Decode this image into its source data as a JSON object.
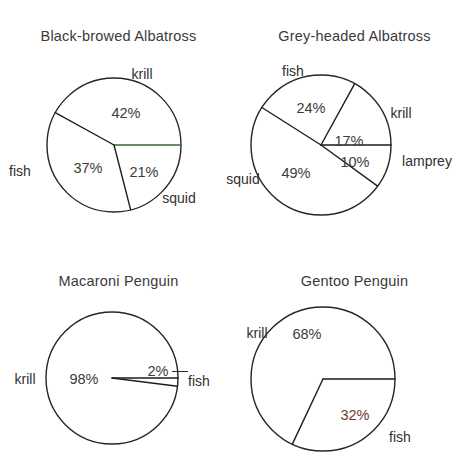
{
  "figure": {
    "background": "#ffffff",
    "outline_color": "#262626",
    "label_color": "#303030",
    "value_color": "#3c3c3c",
    "accent_green": "#2f6b34",
    "accent_maroon": "#6d3a35"
  },
  "chart_data": [
    {
      "type": "pie",
      "title": "Black-browed  Albatross",
      "categories": [
        "krill",
        "fish",
        "squid"
      ],
      "values": [
        42,
        37,
        21
      ],
      "value_labels": [
        "42%",
        "37%",
        "21%"
      ],
      "units": "percent",
      "legend": "none",
      "start_angle_deg": 0,
      "direction": "counterclockwise"
    },
    {
      "type": "pie",
      "title": "Grey-headed  Albatross",
      "categories": [
        "krill",
        "fish",
        "squid",
        "lamprey"
      ],
      "values": [
        17,
        24,
        49,
        10
      ],
      "value_labels": [
        "17%",
        "24%",
        "49%",
        "10%"
      ],
      "units": "percent",
      "legend": "none",
      "start_angle_deg": 0,
      "direction": "counterclockwise"
    },
    {
      "type": "pie",
      "title": "Macaroni  Penguin",
      "categories": [
        "krill",
        "fish"
      ],
      "values": [
        98,
        2
      ],
      "value_labels": [
        "98%",
        "2%"
      ],
      "units": "percent",
      "legend": "none",
      "start_angle_deg": 0,
      "direction": "counterclockwise"
    },
    {
      "type": "pie",
      "title": "Gentoo  Penguin",
      "categories": [
        "krill",
        "fish"
      ],
      "values": [
        68,
        32
      ],
      "value_labels": [
        "68%",
        "32%"
      ],
      "units": "percent",
      "legend": "none",
      "start_angle_deg": 0,
      "direction": "counterclockwise"
    }
  ],
  "panels": [
    {
      "id": "black-browed-albatross",
      "title": "Black-browed  Albatross",
      "geometry": {
        "cx": 114,
        "cy": 145,
        "r": 67
      },
      "slices": [
        {
          "name": "krill",
          "value": "42%",
          "start": 0,
          "end": 151.2,
          "color": "#3c3c3c"
        },
        {
          "name": "fish",
          "value": "37%",
          "start": 151.2,
          "end": 284.4,
          "color": "#3c3c3c"
        },
        {
          "name": "squid",
          "value": "21%",
          "start": 284.4,
          "end": 360,
          "color": "#3c3c3c"
        }
      ],
      "value_positions": [
        {
          "text": "42%",
          "x": 126,
          "y": 113,
          "tone": "normal"
        },
        {
          "text": "37%",
          "x": 88,
          "y": 168,
          "tone": "normal"
        },
        {
          "text": "21%",
          "x": 144,
          "y": 172,
          "tone": "normal"
        }
      ],
      "category_positions": [
        {
          "text": "krill",
          "x": 142,
          "y": 74
        },
        {
          "text": "fish",
          "x": 20,
          "y": 171
        },
        {
          "text": "squid",
          "x": 179,
          "y": 198
        }
      ]
    },
    {
      "id": "grey-headed-albatross",
      "title": "Grey-headed  Albatross",
      "geometry": {
        "cx": 321,
        "cy": 145,
        "r": 70
      },
      "slices": [
        {
          "name": "krill",
          "value": "17%",
          "start": 0,
          "end": 61.2,
          "color": "#3c3c3c"
        },
        {
          "name": "fish",
          "value": "24%",
          "start": 61.2,
          "end": 147.6,
          "color": "#3c3c3c"
        },
        {
          "name": "squid",
          "value": "49%",
          "start": 147.6,
          "end": 324,
          "color": "#3c3c3c"
        },
        {
          "name": "lamprey",
          "value": "10%",
          "start": 324,
          "end": 360,
          "color": "#3c3c3c"
        }
      ],
      "value_positions": [
        {
          "text": "17%",
          "x": 349,
          "y": 141,
          "tone": "normal"
        },
        {
          "text": "24%",
          "x": 311,
          "y": 108,
          "tone": "normal"
        },
        {
          "text": "49%",
          "x": 296,
          "y": 173,
          "tone": "normal"
        },
        {
          "text": "10%",
          "x": 355,
          "y": 162,
          "tone": "normal"
        }
      ],
      "category_positions": [
        {
          "text": "fish",
          "x": 293,
          "y": 71
        },
        {
          "text": "krill",
          "x": 401,
          "y": 113
        },
        {
          "text": "lamprey",
          "x": 427,
          "y": 161
        },
        {
          "text": "squid",
          "x": 243,
          "y": 179
        }
      ]
    },
    {
      "id": "macaroni-penguin",
      "title": "Macaroni  Penguin",
      "geometry": {
        "cx": 112,
        "cy": 378,
        "r": 66
      },
      "slices": [
        {
          "name": "krill",
          "value": "98%",
          "start": 352.8,
          "end": 360,
          "color": "#3c3c3c"
        },
        {
          "name": "fish",
          "value": "2%",
          "start": 0,
          "end": 352.8,
          "color": "#3c3c3c"
        }
      ],
      "value_positions": [
        {
          "text": "98%",
          "x": 84,
          "y": 379,
          "tone": "normal"
        },
        {
          "text": "2%",
          "x": 158,
          "y": 371,
          "tone": "normal"
        }
      ],
      "category_positions": [
        {
          "text": "krill",
          "x": 25,
          "y": 379
        },
        {
          "text": "fish",
          "x": 199,
          "y": 381
        }
      ]
    },
    {
      "id": "gentoo-penguin",
      "title": "Gentoo  Penguin",
      "geometry": {
        "cx": 323,
        "cy": 379,
        "r": 72
      },
      "slices": [
        {
          "name": "krill",
          "value": "68%",
          "start": 0,
          "end": 244.8,
          "color": "#3c3c3c"
        },
        {
          "name": "fish",
          "value": "32%",
          "start": 244.8,
          "end": 360,
          "color": "#3c3c3c"
        }
      ],
      "value_positions": [
        {
          "text": "68%",
          "x": 307,
          "y": 334,
          "tone": "normal"
        },
        {
          "text": "32%",
          "x": 355,
          "y": 415,
          "tone": "maroon"
        }
      ],
      "category_positions": [
        {
          "text": "krill",
          "x": 257,
          "y": 333
        },
        {
          "text": "fish",
          "x": 400,
          "y": 437
        }
      ]
    }
  ]
}
